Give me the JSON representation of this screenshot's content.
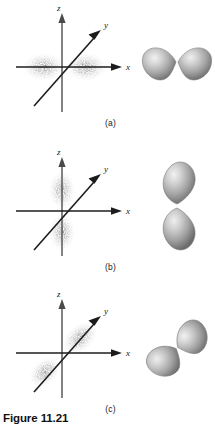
{
  "figure": {
    "caption": "Figure 11.21",
    "axis_labels": {
      "x": "x",
      "y": "y",
      "z": "z"
    },
    "colors": {
      "axis_gray": "#5a5a5a",
      "axis_dark": "#1c1c1c",
      "cloud": "#8d8d8d",
      "lobe_light": "#e8e8e8",
      "lobe_mid": "#a8a8a8",
      "lobe_dark": "#6e6e6e",
      "text": "#1a1a1a",
      "background": "#ffffff"
    },
    "panels": [
      {
        "key": "a",
        "label": "(a)",
        "orbital": "p-x",
        "cloud_orientation": "horizontal",
        "lobe_angle_deg": 0,
        "description": "electron density concentrated along the x axis"
      },
      {
        "key": "b",
        "label": "(b)",
        "orbital": "p-z",
        "cloud_orientation": "vertical",
        "lobe_angle_deg": 90,
        "description": "electron density concentrated along the z axis"
      },
      {
        "key": "c",
        "label": "(c)",
        "orbital": "p-y",
        "cloud_orientation": "diagonal",
        "lobe_angle_deg": 40,
        "description": "electron density concentrated along the y axis"
      }
    ]
  }
}
